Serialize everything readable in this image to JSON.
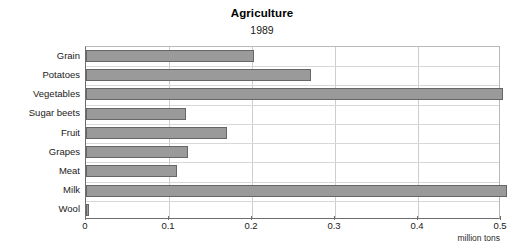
{
  "chart_data": {
    "type": "bar",
    "orientation": "horizontal",
    "title": "Agriculture",
    "subtitle": "1989",
    "xlabel": "million tons",
    "ylabel": "",
    "xlim": [
      0,
      0.5
    ],
    "xticks": [
      "0",
      "0.1",
      "0.2",
      "0.3",
      "0.4",
      "0.5"
    ],
    "xtick_values": [
      0,
      0.1,
      0.2,
      0.3,
      0.4,
      0.5
    ],
    "grid": true,
    "legend": "none",
    "bar_color": "#9a9a9a",
    "bar_border_color": "#666666",
    "categories": [
      "Grain",
      "Potatoes",
      "Vegetables",
      "Sugar beets",
      "Fruit",
      "Grapes",
      "Meat",
      "Milk",
      "Wool"
    ],
    "values": [
      0.203,
      0.271,
      0.502,
      0.121,
      0.17,
      0.123,
      0.11,
      0.507,
      0.004
    ]
  }
}
